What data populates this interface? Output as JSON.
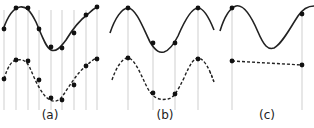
{
  "panels": [
    {
      "label": "(a)",
      "description": "Signal sampled at high rate; reconstruction matches original"
    },
    {
      "label": "(b)",
      "description": "Signal sampled near Nyquist rate; reconstruction approximates original"
    },
    {
      "label": "(c)",
      "description": "Signal undersampled; reconstruction aliases to near-flat line"
    }
  ],
  "colors": {
    "signal": "#222222",
    "sample_line": "#c8c8c8",
    "dot": "#111111"
  }
}
